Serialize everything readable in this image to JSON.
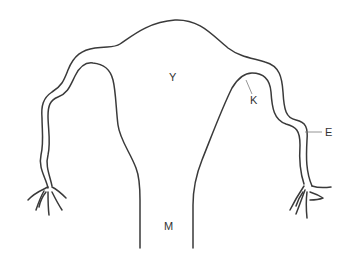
{
  "diagram": {
    "labels": [
      {
        "id": "Y",
        "text": "Y",
        "x": 172,
        "y": 81
      },
      {
        "id": "K",
        "text": "K",
        "x": 253,
        "y": 104
      },
      {
        "id": "E",
        "text": "E",
        "x": 325,
        "y": 136
      },
      {
        "id": "M",
        "text": "M",
        "x": 168,
        "y": 230
      }
    ],
    "leaders": [
      {
        "for": "K",
        "x1": 246,
        "y1": 80,
        "x2": 252,
        "y2": 94
      },
      {
        "for": "E",
        "x1": 305,
        "y1": 132,
        "x2": 322,
        "y2": 132
      }
    ],
    "colors": {
      "stroke": "#3a3a3a",
      "background": "#ffffff",
      "leader": "#7a7a7a"
    }
  }
}
